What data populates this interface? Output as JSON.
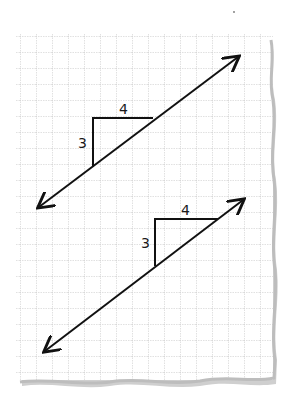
{
  "diagram": {
    "title": "",
    "type": "slope-triangles-on-graph-paper",
    "paper": {
      "left": 16,
      "top": 33,
      "right": 272,
      "bottom": 380,
      "grid_spacing": 16,
      "grid_color": "#b8b8b8",
      "edge_shadow_color": "#c8c8c8"
    },
    "lines": [
      {
        "name": "upper-line",
        "start": [
          39,
          207
        ],
        "end": [
          238,
          57
        ],
        "triangle": {
          "corner": [
            93,
            118
          ],
          "top_right": [
            153,
            118
          ],
          "bottom": [
            93,
            167
          ]
        },
        "rise_label": "3",
        "run_label": "4"
      },
      {
        "name": "lower-line",
        "start": [
          45,
          351
        ],
        "end": [
          243,
          200
        ],
        "triangle": {
          "corner": [
            155,
            219
          ],
          "top_right": [
            218,
            219
          ],
          "bottom": [
            155,
            266
          ]
        },
        "rise_label": "3",
        "run_label": "4"
      }
    ],
    "stroke_color": "#111111"
  }
}
